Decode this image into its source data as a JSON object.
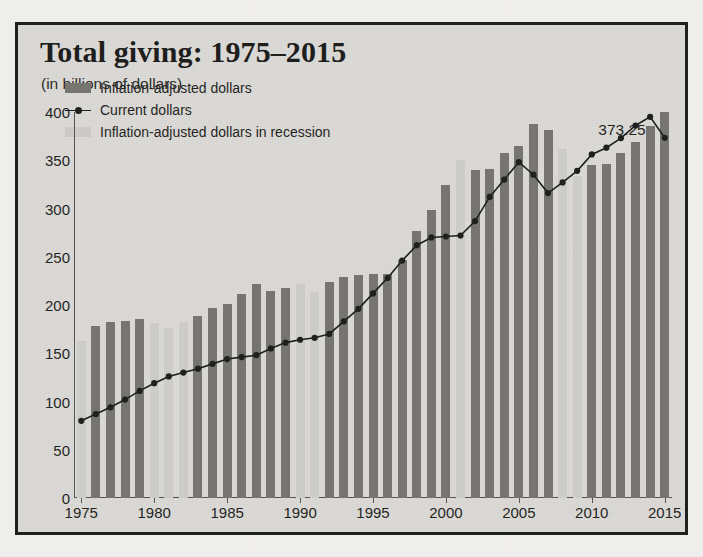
{
  "title": "Total giving: 1975–2015",
  "subtitle": "(in billions of dollars)",
  "annotation": "373.25",
  "legend": [
    {
      "label": "Inflation-adjusted dollars",
      "marker": "bar-swatch-dark",
      "color": "#76746e"
    },
    {
      "label": "Current dollars",
      "marker": "line-with-dot-marker",
      "color": "#1d1d1b"
    },
    {
      "label": "Inflation-adjusted dollars in recession",
      "marker": "bar-swatch-light",
      "color": "#cdcbc6"
    }
  ],
  "colors": {
    "background": "#dcdad6",
    "page": "#f2f1ef",
    "frame": "#1d1d1b",
    "bar_adjusted": "#76746e",
    "bar_recession": "#cdcbc6",
    "line": "#1d1d1b",
    "axis": "#55544f",
    "text": "#1f1f1d"
  },
  "chart_data": {
    "type": "bar",
    "title": "Total giving: 1975–2015",
    "subtitle": "(in billions of dollars)",
    "xlabel": "",
    "ylabel": "",
    "ylim": [
      0,
      400
    ],
    "yticks": [
      0,
      50,
      100,
      150,
      200,
      250,
      300,
      350,
      400
    ],
    "xticks": [
      1975,
      1980,
      1985,
      1990,
      1995,
      2000,
      2005,
      2010,
      2015
    ],
    "grid": false,
    "legend_position": "upper-left-inside",
    "annotations": [
      {
        "text": "373.25",
        "series": "Current dollars",
        "x": 2015,
        "y": 373.25
      }
    ],
    "recession_years": [
      1975,
      1980,
      1981,
      1982,
      1990,
      1991,
      2001,
      2008,
      2009
    ],
    "categories": [
      1975,
      1976,
      1977,
      1978,
      1979,
      1980,
      1981,
      1982,
      1983,
      1984,
      1985,
      1986,
      1987,
      1988,
      1989,
      1990,
      1991,
      1992,
      1993,
      1994,
      1995,
      1996,
      1997,
      1998,
      1999,
      2000,
      2001,
      2002,
      2003,
      2004,
      2005,
      2006,
      2007,
      2008,
      2009,
      2010,
      2011,
      2012,
      2013,
      2014,
      2015
    ],
    "series": [
      {
        "name": "Inflation-adjusted dollars",
        "type": "bar",
        "values": [
          163,
          178,
          182,
          183,
          185,
          181,
          176,
          182,
          189,
          197,
          201,
          211,
          222,
          215,
          218,
          222,
          214,
          224,
          229,
          231,
          232,
          232,
          247,
          277,
          298,
          324,
          350,
          340,
          341,
          358,
          365,
          388,
          381,
          362,
          334,
          345,
          346,
          358,
          369,
          386,
          400
        ]
      },
      {
        "name": "Current dollars",
        "type": "line",
        "values": [
          80,
          87,
          94,
          102,
          111,
          121,
          131,
          138,
          145,
          153,
          162,
          170,
          175,
          180,
          186,
          192,
          196,
          198,
          204,
          212,
          223,
          235,
          253,
          277,
          298,
          308,
          322,
          327,
          336,
          338,
          350,
          333,
          315,
          334,
          345,
          361,
          373.25,
          373.25,
          373.25,
          373.25,
          373.25
        ]
      }
    ],
    "current_dollars_points": [
      {
        "year": 1975,
        "value": 80
      },
      {
        "year": 1976,
        "value": 87
      },
      {
        "year": 1977,
        "value": 94
      },
      {
        "year": 1978,
        "value": 102
      },
      {
        "year": 1979,
        "value": 111
      },
      {
        "year": 1980,
        "value": 119
      },
      {
        "year": 1981,
        "value": 126
      },
      {
        "year": 1982,
        "value": 130
      },
      {
        "year": 1983,
        "value": 134
      },
      {
        "year": 1984,
        "value": 139
      },
      {
        "year": 1985,
        "value": 144
      },
      {
        "year": 1986,
        "value": 146
      },
      {
        "year": 1987,
        "value": 148
      },
      {
        "year": 1988,
        "value": 155
      },
      {
        "year": 1989,
        "value": 161
      },
      {
        "year": 1990,
        "value": 164
      },
      {
        "year": 1991,
        "value": 166
      },
      {
        "year": 1992,
        "value": 170
      },
      {
        "year": 1993,
        "value": 183
      },
      {
        "year": 1994,
        "value": 196
      },
      {
        "year": 1995,
        "value": 212
      },
      {
        "year": 1996,
        "value": 228
      },
      {
        "year": 1997,
        "value": 246
      },
      {
        "year": 1998,
        "value": 262
      },
      {
        "year": 1999,
        "value": 270
      },
      {
        "year": 2000,
        "value": 271
      },
      {
        "year": 2001,
        "value": 272
      },
      {
        "year": 2002,
        "value": 287
      },
      {
        "year": 2003,
        "value": 312
      },
      {
        "year": 2004,
        "value": 330
      },
      {
        "year": 2005,
        "value": 348
      },
      {
        "year": 2006,
        "value": 335
      },
      {
        "year": 2007,
        "value": 316
      },
      {
        "year": 2008,
        "value": 327
      },
      {
        "year": 2009,
        "value": 339
      },
      {
        "year": 2010,
        "value": 356
      },
      {
        "year": 2011,
        "value": 363
      },
      {
        "year": 2012,
        "value": 373
      },
      {
        "year": 2013,
        "value": 386
      },
      {
        "year": 2014,
        "value": 395
      },
      {
        "year": 2015,
        "value": 373.25
      }
    ]
  }
}
